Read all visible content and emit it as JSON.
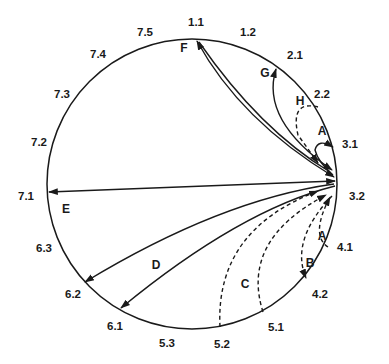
{
  "diagram": {
    "type": "circular-transition-diagram",
    "circle": {
      "cx": 192,
      "cy": 184,
      "r": 145
    },
    "hub": "3.2",
    "nodes": [
      {
        "id": "1.1",
        "label": "1.1",
        "x": 196,
        "y": 26
      },
      {
        "id": "1.2",
        "label": "1.2",
        "x": 248,
        "y": 36
      },
      {
        "id": "2.1",
        "label": "2.1",
        "x": 295,
        "y": 59
      },
      {
        "id": "2.2",
        "label": "2.2",
        "x": 322,
        "y": 98
      },
      {
        "id": "3.1",
        "label": "3.1",
        "x": 346,
        "y": 145
      },
      {
        "id": "3.2",
        "label": "3.2",
        "x": 351,
        "y": 200
      },
      {
        "id": "4.1",
        "label": "4.1",
        "x": 343,
        "y": 251
      },
      {
        "id": "4.2",
        "label": "4.2",
        "x": 320,
        "y": 298
      },
      {
        "id": "5.1",
        "label": "5.1",
        "x": 276,
        "y": 331
      },
      {
        "id": "5.2",
        "label": "5.2",
        "x": 222,
        "y": 348
      },
      {
        "id": "5.3",
        "label": "5.3",
        "x": 167,
        "y": 347
      },
      {
        "id": "6.1",
        "label": "6.1",
        "x": 115,
        "y": 330
      },
      {
        "id": "6.2",
        "label": "6.2",
        "x": 73,
        "y": 298
      },
      {
        "id": "6.3",
        "label": "6.3",
        "x": 44,
        "y": 252
      },
      {
        "id": "7.1",
        "label": "7.1",
        "x": 23,
        "y": 200
      },
      {
        "id": "7.2",
        "label": "7.2",
        "x": 39,
        "y": 146
      },
      {
        "id": "7.3",
        "label": "7.3",
        "x": 62,
        "y": 98
      },
      {
        "id": "7.4",
        "label": "7.4",
        "x": 98,
        "y": 58
      },
      {
        "id": "7.5",
        "label": "7.5",
        "x": 145,
        "y": 36
      }
    ],
    "edge_labels": [
      {
        "id": "A_upper",
        "label": "A",
        "x": 318,
        "y": 130
      },
      {
        "id": "A_lower",
        "label": "A",
        "x": 320,
        "y": 236
      },
      {
        "id": "B",
        "label": "B",
        "x": 306,
        "y": 266
      },
      {
        "id": "C",
        "label": "C",
        "x": 243,
        "y": 287
      },
      {
        "id": "D",
        "label": "D",
        "x": 151,
        "y": 269
      },
      {
        "id": "E",
        "label": "E",
        "x": 62,
        "y": 214
      },
      {
        "id": "F",
        "label": "F",
        "x": 180,
        "y": 51
      },
      {
        "id": "G",
        "label": "G",
        "x": 261,
        "y": 76
      },
      {
        "id": "H",
        "label": "H",
        "x": 297,
        "y": 105
      }
    ],
    "edges": [
      {
        "label": "A",
        "from": "3.1",
        "to": "3.2",
        "style": "solid"
      },
      {
        "label": "A",
        "from": "4.1",
        "to": "3.2",
        "style": "dashed"
      },
      {
        "label": "B",
        "from": "3.2",
        "to": "4.2",
        "style": "dashed"
      },
      {
        "label": "C",
        "from": "5.1",
        "to": "3.2",
        "style": "dashed"
      },
      {
        "label": "C",
        "from": "5.2",
        "to": "3.2",
        "style": "dashed"
      },
      {
        "label": "D",
        "from": "3.2",
        "to": "6.1",
        "style": "solid"
      },
      {
        "label": "D",
        "from": "3.2",
        "to": "6.2",
        "style": "solid"
      },
      {
        "label": "E",
        "from": "3.2",
        "to": "7.1",
        "style": "solid",
        "bidirectional": true
      },
      {
        "label": "F",
        "from": "3.2",
        "to": "1.1",
        "style": "solid",
        "bidirectional": true
      },
      {
        "label": "G",
        "from": "3.2",
        "to": "2.1",
        "style": "solid",
        "bidirectional": true
      },
      {
        "label": "H",
        "from": "2.2",
        "to": "3.2",
        "style": "dashed"
      }
    ]
  }
}
